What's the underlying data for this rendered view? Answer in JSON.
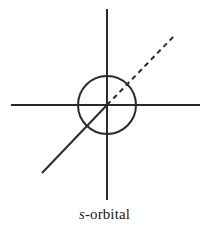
{
  "figure": {
    "title": "s-orbital",
    "caption": {
      "symbol": "s",
      "remainder": "-orbital"
    },
    "background_color": "#ffffff",
    "stroke_color": "#2a2a2a"
  },
  "diagram_data": {
    "type": "diagram",
    "subject": "atomic orbital axis diagram",
    "canvas": {
      "width": 209,
      "height": 236
    },
    "origin": {
      "x": 107,
      "y": 105
    },
    "elements": [
      {
        "name": "y-axis",
        "kind": "line",
        "style": "solid",
        "x1": 107,
        "y1": 9,
        "x2": 107,
        "y2": 200,
        "stroke": "#2a2a2a",
        "stroke_width": 2
      },
      {
        "name": "x-axis",
        "kind": "line",
        "style": "solid",
        "x1": 11,
        "y1": 105,
        "x2": 200,
        "y2": 105,
        "stroke": "#2a2a2a",
        "stroke_width": 2
      },
      {
        "name": "z-axis-front",
        "kind": "line",
        "style": "solid",
        "x1": 42,
        "y1": 173,
        "x2": 107,
        "y2": 105,
        "stroke": "#2a2a2a",
        "stroke_width": 2
      },
      {
        "name": "z-axis-back",
        "kind": "line",
        "style": "dashed",
        "x1": 107,
        "y1": 105,
        "x2": 176,
        "y2": 34,
        "stroke": "#2a2a2a",
        "stroke_width": 2,
        "dash_length": 5,
        "gap_length": 4
      },
      {
        "name": "s-orbital-sphere",
        "kind": "circle",
        "style": "solid",
        "cx": 107,
        "cy": 105,
        "r": 29,
        "stroke": "#2a2a2a",
        "stroke_width": 2,
        "fill": "none"
      }
    ]
  }
}
